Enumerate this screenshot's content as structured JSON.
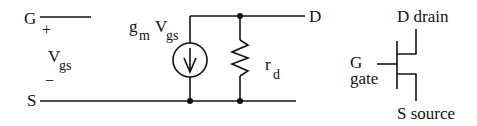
{
  "small_signal_model": {
    "gate_label": "G",
    "source_label": "S",
    "drain_label": "D",
    "plus_sign": "+",
    "minus_sign": "−",
    "vgs_main": "V",
    "vgs_sub": "gs",
    "current_source": {
      "gm_main": "g",
      "gm_sub": "m",
      "v_main": "V",
      "v_sub": "gs",
      "icon": "current-source-arrow-down"
    },
    "resistor": {
      "main": "r",
      "sub": "d",
      "icon": "resistor-zigzag"
    }
  },
  "mosfet_symbol": {
    "drain_label": "D drain",
    "gate_label_line1": "G",
    "gate_label_line2": "gate",
    "source_label": "S source",
    "icon": "mosfet-symbol"
  }
}
